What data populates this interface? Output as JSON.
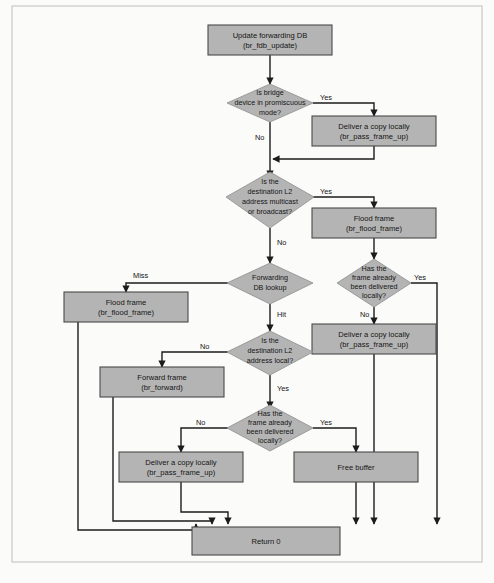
{
  "figure": {
    "caption": "",
    "colors": {
      "node_fill": "#b4b4b4",
      "node_stroke": "#4a4a4a",
      "connector": "#1c1c1c",
      "frame": "#c9c9c9",
      "background": "#ffffff"
    }
  },
  "nodes": {
    "update_fdb": {
      "shape": "process",
      "line1": "Update forwarding DB",
      "line2": "(br_fdb_update)"
    },
    "promiscuous": {
      "shape": "decision",
      "line1": "Is bridge",
      "line2": "device in promiscuous",
      "line3": "mode?"
    },
    "deliver_copy_1": {
      "shape": "process",
      "line1": "Deliver a copy locally",
      "line2": "(br_pass_frame_up)"
    },
    "mcast_bcast": {
      "shape": "decision",
      "line1": "Is the",
      "line2": "destination L2",
      "line3": "address multicast",
      "line4": "or broadcast?"
    },
    "flood_frame_right": {
      "shape": "process",
      "line1": "Flood frame",
      "line2": "(br_flood_frame)"
    },
    "fdb_lookup": {
      "shape": "decision",
      "line1": "Forwarding",
      "line2": "DB lookup"
    },
    "delivered_locally_1": {
      "shape": "decision",
      "line1": "Has the",
      "line2": "frame already",
      "line3": "been delivered",
      "line4": "locally?"
    },
    "flood_frame_left": {
      "shape": "process",
      "line1": "Flood frame",
      "line2": "(br_flood_frame)"
    },
    "deliver_copy_2": {
      "shape": "process",
      "line1": "Deliver a copy locally",
      "line2": "(br_pass_frame_up)"
    },
    "dest_local": {
      "shape": "decision",
      "line1": "Is the",
      "line2": "destination L2",
      "line3": "address local?"
    },
    "forward_frame": {
      "shape": "process",
      "line1": "Forward frame",
      "line2": "(br_forward)"
    },
    "delivered_locally_2": {
      "shape": "decision",
      "line1": "Has the",
      "line2": "frame already",
      "line3": "been delivered",
      "line4": "locally?"
    },
    "deliver_copy_3": {
      "shape": "process",
      "line1": "Deliver a copy locally",
      "line2": "(br_pass_frame_up)"
    },
    "free_buffer": {
      "shape": "process",
      "line1": "Free buffer",
      "line2": ""
    },
    "return_zero": {
      "shape": "process",
      "line1": "Return 0",
      "line2": ""
    }
  },
  "edge_labels": {
    "promiscuous_yes": "Yes",
    "promiscuous_no": "No",
    "mcast_yes": "Yes",
    "mcast_no": "No",
    "lookup_miss": "Miss",
    "lookup_hit": "Hit",
    "delivered1_yes": "Yes",
    "delivered1_no": "No",
    "dest_local_no": "No",
    "dest_local_yes": "Yes",
    "delivered2_no": "No",
    "delivered2_yes": "Yes"
  }
}
